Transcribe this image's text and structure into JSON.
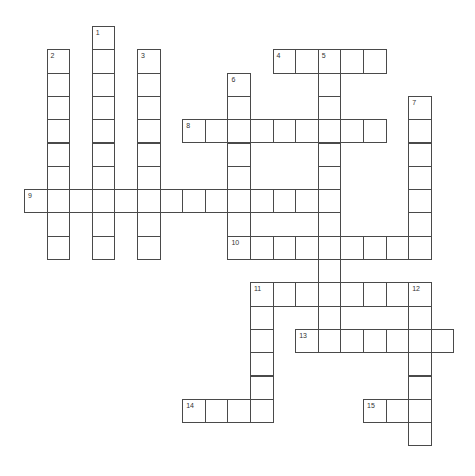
{
  "puzzle": {
    "type": "crossword",
    "grid": {
      "origin_x": 24,
      "origin_y": 26,
      "step_x": 22.6,
      "step_y": 23.3
    },
    "entries": [
      {
        "number": "1",
        "direction": "down",
        "row": 0,
        "col": 3,
        "length": 10
      },
      {
        "number": "2",
        "direction": "down",
        "row": 1,
        "col": 1,
        "length": 9
      },
      {
        "number": "3",
        "direction": "down",
        "row": 1,
        "col": 5,
        "length": 9
      },
      {
        "number": "4",
        "direction": "across",
        "row": 1,
        "col": 11,
        "length": 5
      },
      {
        "number": "5",
        "direction": "down",
        "row": 1,
        "col": 13,
        "length": 13
      },
      {
        "number": "6",
        "direction": "down",
        "row": 2,
        "col": 9,
        "length": 8
      },
      {
        "number": "7",
        "direction": "down",
        "row": 3,
        "col": 17,
        "length": 7
      },
      {
        "number": "8",
        "direction": "across",
        "row": 4,
        "col": 7,
        "length": 9
      },
      {
        "number": "9",
        "direction": "across",
        "row": 7,
        "col": 0,
        "length": 14
      },
      {
        "number": "10",
        "direction": "across",
        "row": 9,
        "col": 9,
        "length": 9
      },
      {
        "number": "11",
        "direction": "across",
        "row": 11,
        "col": 10,
        "length": 8
      },
      {
        "number": "11",
        "direction": "down",
        "row": 11,
        "col": 10,
        "length": 6
      },
      {
        "number": "12",
        "direction": "down",
        "row": 11,
        "col": 17,
        "length": 7
      },
      {
        "number": "13",
        "direction": "across",
        "row": 13,
        "col": 12,
        "length": 7
      },
      {
        "number": "14",
        "direction": "across",
        "row": 16,
        "col": 7,
        "length": 4
      },
      {
        "number": "15",
        "direction": "across",
        "row": 16,
        "col": 15,
        "length": 3
      }
    ]
  }
}
